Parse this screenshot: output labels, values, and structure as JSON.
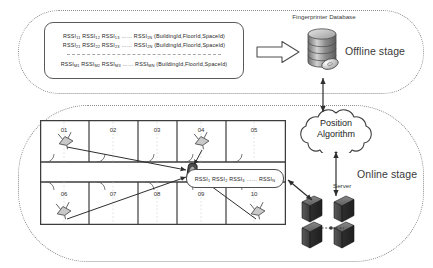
{
  "offline": {
    "stage_label": "Offline stage",
    "database_label": "Fingerprinter Database",
    "fingerprint_rows": [
      {
        "id": "row-1",
        "prefix": "RSSI",
        "cells": [
          "RSSI11",
          "RSSI12",
          "RSSI13"
        ],
        "ellipsis": "……",
        "last": "RSSI1N",
        "tuple": "(BuildingId,FloorId,SpaceId)"
      },
      {
        "id": "row-2",
        "prefix": "RSSI",
        "cells": [
          "RSSI21",
          "RSSI22",
          "RSSI23"
        ],
        "ellipsis": "……",
        "last": "RSSI2N",
        "tuple": "(BuildingId,FloorId,SpaceId)"
      },
      {
        "id": "row-m",
        "prefix": "RSSI",
        "cells": [
          "RSSIM1",
          "RSSIM2",
          "RSSIM3"
        ],
        "ellipsis": "……",
        "last": "RSSIMN",
        "tuple": "(BuildingId,FloorId,SpaceId)"
      }
    ],
    "arrow_direction": "right"
  },
  "online": {
    "stage_label": "Online stage",
    "cloud_line_1": "Position",
    "cloud_line_2": "Algorithm",
    "server_label": "Server",
    "measurement_bubble": {
      "cells": [
        "RSSI1",
        "RSSI2",
        "RSSI3"
      ],
      "ellipsis": "……",
      "last": "RSSIN"
    },
    "floor_plan": {
      "rooms_top": [
        "01",
        "02",
        "03",
        "04",
        "05"
      ],
      "rooms_bottom": [
        "06",
        "07",
        "08",
        "09",
        "10"
      ],
      "access_points": 4,
      "mobile_device": "smartphone"
    }
  },
  "colors": {
    "stroke": "#5a5a5a",
    "dotted_border": "#8d8d8d",
    "text": "#2b2b2b",
    "server_dark": "#4a4a4a",
    "db_gray": "#9a9a9a"
  }
}
